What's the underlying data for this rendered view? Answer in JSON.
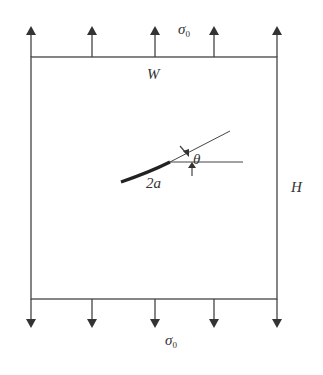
{
  "diagram": {
    "labels": {
      "stress_top": "σ",
      "stress_top_sub": "0",
      "stress_bottom": "σ",
      "stress_bottom_sub": "0",
      "width": "W",
      "height": "H",
      "crack_length": "2a",
      "angle": "θ"
    },
    "colors": {
      "line": "#444444",
      "crack": "#222222"
    }
  }
}
